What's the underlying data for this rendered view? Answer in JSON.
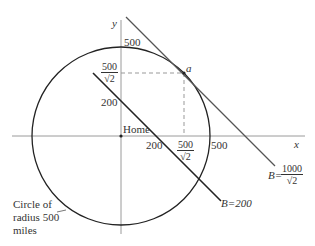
{
  "diagram": {
    "axes": {
      "x_label": "x",
      "y_label": "y"
    },
    "origin_label": "Home",
    "ticks": {
      "y_500": "500",
      "y_500_sqrt2_num": "500",
      "y_500_sqrt2_den": "√2",
      "y_200": "200",
      "x_200": "200",
      "x_500_sqrt2_num": "500",
      "x_500_sqrt2_den": "√2",
      "x_500": "500"
    },
    "point_label": "a",
    "lines": {
      "b200_label": "B=200",
      "b1000_prefix": "B=",
      "b1000_num": "1000",
      "b1000_den": "√2"
    },
    "circle_caption": [
      "Circle of",
      "radius 500",
      "miles"
    ],
    "colors": {
      "axis": "#9a9a9a",
      "curve": "#222222",
      "tangent": "#555555",
      "dashed": "#999999"
    }
  }
}
